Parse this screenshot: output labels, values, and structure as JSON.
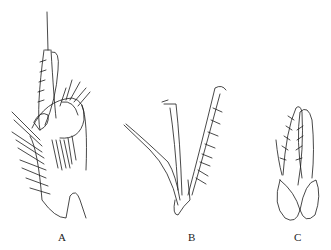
{
  "figure": {
    "panels": [
      {
        "label": "A",
        "x": 58
      },
      {
        "label": "B",
        "x": 188
      },
      {
        "label": "C",
        "x": 294
      }
    ],
    "stroke_color": "#1a1a1a",
    "background": "#ffffff"
  }
}
